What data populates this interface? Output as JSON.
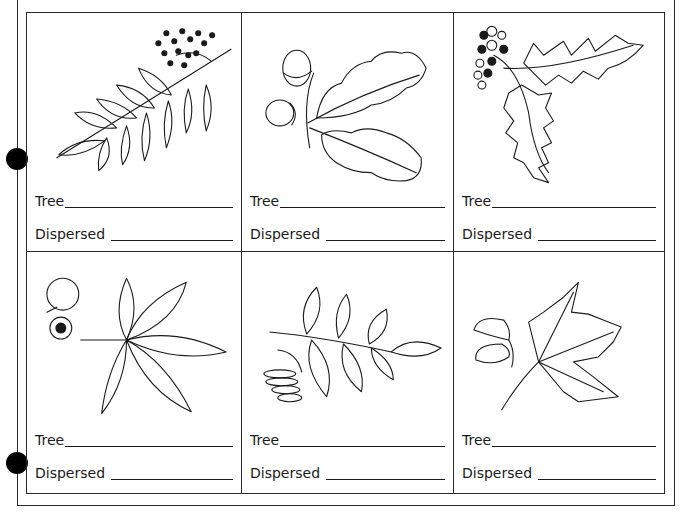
{
  "worksheet": {
    "cells": [
      {
        "illustration": "rowan-leaf-with-berries-icon",
        "tree_label": "Tree",
        "dispersed_label": "Dispersed"
      },
      {
        "illustration": "oak-leaf-with-acorns-icon",
        "tree_label": "Tree",
        "dispersed_label": "Dispersed"
      },
      {
        "illustration": "holly-leaf-with-berries-icon",
        "tree_label": "Tree",
        "dispersed_label": "Dispersed"
      },
      {
        "illustration": "horse-chestnut-leaf-with-conker-icon",
        "tree_label": "Tree",
        "dispersed_label": "Dispersed"
      },
      {
        "illustration": "ash-leaf-with-keys-icon",
        "tree_label": "Tree",
        "dispersed_label": "Dispersed"
      },
      {
        "illustration": "sycamore-leaf-with-seed-icon",
        "tree_label": "Tree",
        "dispersed_label": "Dispersed"
      }
    ]
  }
}
